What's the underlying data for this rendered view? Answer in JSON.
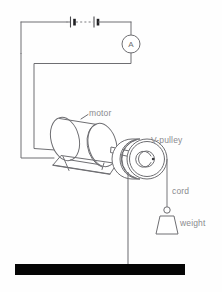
{
  "figure": {
    "background_color": "#fefefe",
    "line_color": "#6e6e72",
    "label_color": "#8a8a8e",
    "ground_color": "#050505",
    "width": 222,
    "height": 292
  },
  "labels": {
    "motor": "motor",
    "v_pulley": "V-pulley",
    "cord": "cord",
    "weight": "weight",
    "ammeter": "A"
  },
  "components": [
    {
      "id": "battery",
      "name": "battery-symbol",
      "label": "",
      "cells": 2
    },
    {
      "id": "ammeter",
      "name": "ammeter",
      "label": "A"
    },
    {
      "id": "motor",
      "name": "motor",
      "label": "motor"
    },
    {
      "id": "pulley",
      "name": "v-pulley",
      "label": "V-pulley"
    },
    {
      "id": "cord",
      "name": "cord",
      "label": "cord"
    },
    {
      "id": "weight",
      "name": "weight",
      "label": "weight"
    },
    {
      "id": "ground",
      "name": "ground-bar",
      "label": ""
    },
    {
      "id": "post",
      "name": "support-post",
      "label": ""
    }
  ],
  "circuit": {
    "description": "Two-cell battery in series with an ammeter, wired to the motor terminals",
    "elements_in_series": [
      "battery",
      "ammeter",
      "motor"
    ]
  }
}
